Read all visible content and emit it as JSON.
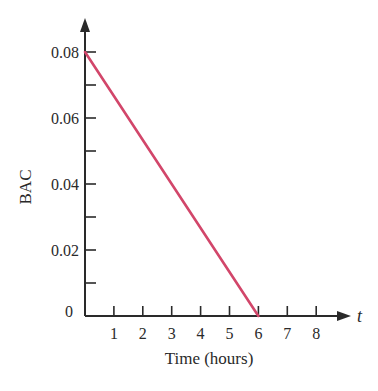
{
  "chart_data": {
    "type": "line",
    "title": "",
    "xlabel": "Time (hours)",
    "ylabel": "BAC",
    "x_axis_variable": "t",
    "x": [
      0,
      6
    ],
    "series": [
      {
        "name": "BAC",
        "x": [
          0,
          6
        ],
        "values": [
          0.08,
          0.0
        ],
        "color": "#d2466a"
      }
    ],
    "xlim": [
      0,
      8
    ],
    "ylim": [
      0,
      0.08
    ],
    "x_ticks": [
      1,
      2,
      3,
      4,
      5,
      6,
      7,
      8
    ],
    "x_tick_labels": [
      "1",
      "2",
      "3",
      "4",
      "5",
      "6",
      "7",
      "8"
    ],
    "y_ticks": [
      0,
      0.01,
      0.02,
      0.03,
      0.04,
      0.05,
      0.06,
      0.07,
      0.08
    ],
    "y_tick_labels": [
      "0",
      "",
      "0.02",
      "",
      "0.04",
      "",
      "0.06",
      "",
      "0.08"
    ],
    "grid": false,
    "legend": null
  },
  "colors": {
    "line": "#d2466a",
    "axis": "#2a2a2a",
    "background": "#ffffff"
  }
}
